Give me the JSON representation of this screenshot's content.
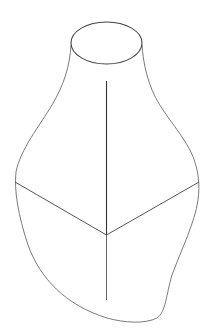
{
  "figure": {
    "width": 208,
    "height": 336,
    "background": "#ffffff",
    "stroke_color": "#555555",
    "stroke_color_light": "#8a8a8a",
    "top_opening": {
      "cx": 106.5,
      "cy": 43,
      "rx": 35.5,
      "ry": 21
    },
    "outline_path": "M71,45 C70,65 64,85 52,105 C40,125 20,150 16,172 C14,190 18,215 28,245 C40,278 65,305 107,318 C125,323 145,324 157,318 C166,312 166,295 172,275 C182,248 195,222 198,200 C200,185 199,168 190,150 C178,128 160,110 152,90 C146,75 143,60 142,45",
    "ridge_top": {
      "x1": 106.5,
      "y1": 81,
      "x2": 106.5,
      "y2": 235
    },
    "ridge_bottom": {
      "x1": 106.5,
      "y1": 235,
      "x2": 106.5,
      "y2": 300
    },
    "left_edge": {
      "x1": 15,
      "y1": 182,
      "x2": 106.5,
      "y2": 235
    },
    "right_edge": {
      "x1": 199,
      "y1": 182,
      "x2": 106.5,
      "y2": 235
    }
  }
}
